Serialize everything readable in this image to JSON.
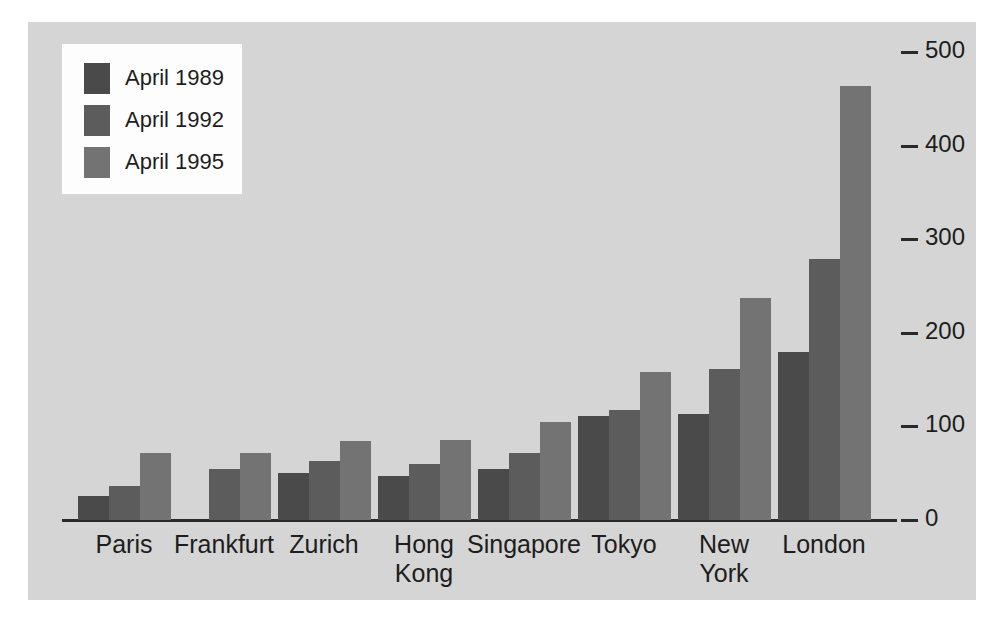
{
  "chart_data": {
    "type": "bar",
    "title": "",
    "subtitle": "",
    "xlabel": "",
    "ylabel": "",
    "ylim": [
      0,
      500
    ],
    "yticks": [
      0,
      100,
      200,
      300,
      400,
      500
    ],
    "ytick_labels": [
      "0",
      "100",
      "200",
      "300",
      "400",
      "500"
    ],
    "grid": false,
    "legend_position": "top-left",
    "categories": [
      "Paris",
      "Frankfurt",
      "Zurich",
      "Hong\nKong",
      "Singapore",
      "Tokyo",
      "New\nYork",
      "London"
    ],
    "series": [
      {
        "name": "April 1989",
        "color": "#4a4a4a",
        "values": [
          26,
          null,
          50,
          47,
          55,
          111,
          113,
          180
        ]
      },
      {
        "name": "April 1992",
        "color": "#5c5c5c",
        "values": [
          36,
          54,
          63,
          60,
          72,
          118,
          161,
          279
        ]
      },
      {
        "name": "April 1995",
        "color": "#737373",
        "values": [
          72,
          72,
          84,
          86,
          105,
          158,
          237,
          464
        ]
      }
    ]
  },
  "legend": {
    "items": [
      {
        "label": "April 1989"
      },
      {
        "label": "April 1992"
      },
      {
        "label": "April 1995"
      }
    ]
  },
  "axis": {
    "y_tick_labels": [
      "500",
      "400",
      "300",
      "200",
      "100",
      "0"
    ]
  },
  "colors": {
    "panel_background": "#d5d5d5",
    "legend_background": "#fdfdfd",
    "axis": "#2a2a2a",
    "text": "#1d1d1d",
    "series_1989": "#4a4a4a",
    "series_1992": "#5c5c5c",
    "series_1995": "#737373"
  }
}
